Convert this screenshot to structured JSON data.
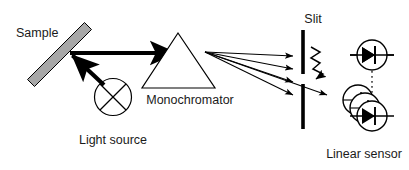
{
  "figure": {
    "background_color": "#ffffff",
    "stroke_color": "#000000",
    "sample_fill_color": "#a8a8a8",
    "width": 409,
    "height": 170
  },
  "labels": {
    "sample": "Sample",
    "light_source": "Light source",
    "monochromator": "Monochromator",
    "slit": "Slit",
    "linear_sensor": "Linear sensor"
  },
  "components": {
    "sample": {
      "name": "Sample",
      "shape": "tilted-bar",
      "fill": "#a8a8a8",
      "stroke": "#000000",
      "x1": 30,
      "y1": 75,
      "x2": 88,
      "y2": 26,
      "thickness": 9
    },
    "light_source": {
      "name": "Light source",
      "shape": "circle-with-cross",
      "cx": 113,
      "cy": 97,
      "r": 18
    },
    "monochromator": {
      "name": "Monochromator",
      "shape": "triangle-prism",
      "apex_x": 178,
      "apex_y": 34,
      "left_x": 143,
      "left_y": 88,
      "right_x": 215,
      "right_y": 88
    },
    "slit": {
      "name": "Slit",
      "shape": "two-vertical-bars",
      "x": 303,
      "top_bar": {
        "y1": 30,
        "y2": 74
      },
      "bottom_bar": {
        "y1": 84,
        "y2": 128
      },
      "width": 3.5
    },
    "photodiode_single": {
      "name": "Photodiode",
      "shape": "circle-with-diode",
      "cx": 372,
      "cy": 55,
      "r": 15
    },
    "photodiode_array": {
      "name": "Linear photodiode array",
      "shape": "stacked-circles-with-diode",
      "count": 3,
      "front_cx": 372,
      "front_cy": 116,
      "r": 15,
      "offset_x": -7,
      "offset_y": -8
    }
  },
  "beams": {
    "source_to_sample": {
      "name": "Light source to sample beam",
      "style": "thick-solid-arrow",
      "x1": 105,
      "y1": 84,
      "x2": 70,
      "y2": 53
    },
    "sample_to_monochromator": {
      "name": "Sample to monochromator beam",
      "style": "thick-solid-arrow",
      "x1": 70,
      "y1": 53,
      "x2": 175,
      "y2": 53
    },
    "dispersed_rays": {
      "name": "Dispersed spectrum rays",
      "style": "thin-solid-arrows",
      "origin_x": 205,
      "origin_y": 52,
      "count": 5,
      "end_points": [
        {
          "x": 296,
          "y": 56
        },
        {
          "x": 296,
          "y": 69
        },
        {
          "x": 296,
          "y": 82
        },
        {
          "x": 296,
          "y": 95
        },
        {
          "x": 330,
          "y": 96
        }
      ]
    },
    "wavy_selected": {
      "name": "Selected wavelength wavy arrow",
      "style": "zigzag-arrow",
      "x1": 312,
      "y1": 50,
      "x2": 338,
      "y2": 82
    },
    "sensor_link": {
      "name": "Photodiode to array dotted link",
      "style": "dotted",
      "x1": 372,
      "y1": 72,
      "x2": 372,
      "y2": 95
    }
  }
}
